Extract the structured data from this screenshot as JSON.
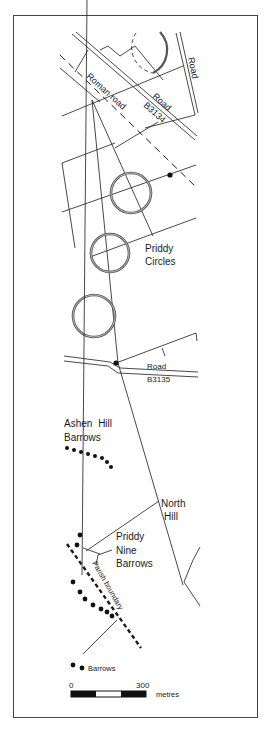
{
  "map": {
    "title": "Priddy Circles and barrows",
    "labels": {
      "road_top_right": "Road",
      "roman_road": "Roman road",
      "road_b3134_1": "Road",
      "road_b3134_2": "B3134",
      "priddy_circles_1": "Priddy",
      "priddy_circles_2": "Circles",
      "road_b3135_1": "Road",
      "road_b3135_2": "B3135",
      "ashen_hill_1": "Ashen Hill",
      "ashen_hill_2": "Barrows",
      "north_hill_1": "North",
      "north_hill_2": "Hill",
      "nine_barrows_1": "Priddy",
      "nine_barrows_2": "Nine",
      "nine_barrows_3": "Barrows",
      "parish_boundary": "Parish boundary",
      "barrows": "Barrows"
    },
    "scale_bar": {
      "start_label": "0",
      "end_label": "300",
      "unit": "metres"
    },
    "colors": {
      "ink": "#1a1a1a",
      "frame": "#444444",
      "background": "#ffffff"
    }
  }
}
